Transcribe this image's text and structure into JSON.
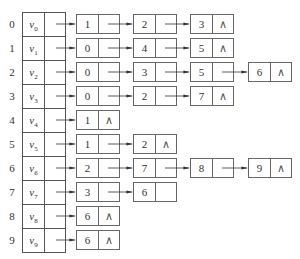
{
  "diagram": {
    "type": "adjacency-list",
    "null_symbol": "∧",
    "vertices": [
      {
        "index": "0",
        "name": "v",
        "sub": "0",
        "adj": [
          "1",
          "2",
          "3"
        ]
      },
      {
        "index": "1",
        "name": "v",
        "sub": "1",
        "adj": [
          "0",
          "4",
          "5"
        ]
      },
      {
        "index": "2",
        "name": "v",
        "sub": "2",
        "adj": [
          "0",
          "3",
          "5",
          "6"
        ]
      },
      {
        "index": "3",
        "name": "v",
        "sub": "3",
        "adj": [
          "0",
          "2",
          "7"
        ]
      },
      {
        "index": "4",
        "name": "v",
        "sub": "4",
        "adj": [
          "1"
        ]
      },
      {
        "index": "5",
        "name": "v",
        "sub": "5",
        "adj": [
          "1",
          "2"
        ]
      },
      {
        "index": "6",
        "name": "v",
        "sub": "6",
        "adj": [
          "2",
          "7",
          "8",
          "9"
        ]
      },
      {
        "index": "7",
        "name": "v",
        "sub": "7",
        "adj": [
          "3",
          "6"
        ],
        "last_open": true
      },
      {
        "index": "8",
        "name": "v",
        "sub": "8",
        "adj": [
          "6"
        ]
      },
      {
        "index": "9",
        "name": "v",
        "sub": "9",
        "adj": [
          "6"
        ]
      }
    ],
    "colors": {
      "line": "#555555",
      "text": "#333333",
      "background": "#ffffff"
    }
  }
}
